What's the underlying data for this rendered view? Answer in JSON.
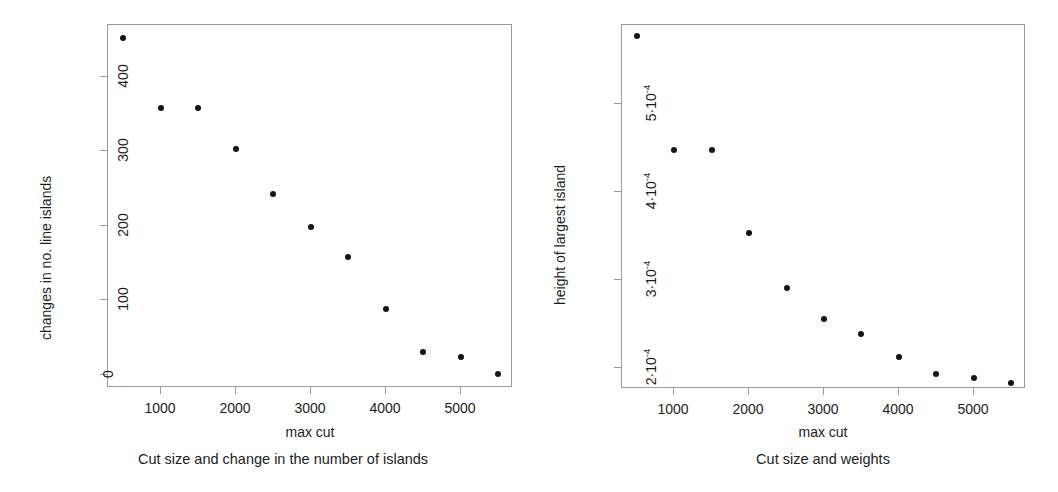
{
  "figure": {
    "background": "#ffffff",
    "point_color": "#151515",
    "axis_color": "#9a9a9a"
  },
  "chart_data": [
    {
      "type": "scatter",
      "panel": "left",
      "title": "",
      "caption": "Cut size and change in the number of islands",
      "xlabel": "max cut",
      "ylabel": "changes in no. line islands",
      "grid": false,
      "legend": "none",
      "xlim": [
        300,
        5700
      ],
      "ylim": [
        -18,
        470
      ],
      "xticks": [
        1000,
        2000,
        3000,
        4000,
        5000
      ],
      "xtick_labels": [
        "1000",
        "2000",
        "3000",
        "4000",
        "5000"
      ],
      "yticks": [
        0,
        100,
        200,
        300,
        400
      ],
      "ytick_labels": [
        "0",
        "100",
        "200",
        "300",
        "400"
      ],
      "x": [
        500,
        1000,
        1500,
        2000,
        2500,
        3000,
        3500,
        4000,
        4500,
        5000,
        5500
      ],
      "y": [
        452,
        359,
        359,
        303,
        243,
        199,
        158,
        88,
        30,
        24,
        1
      ],
      "point_labels": [
        "500, 452",
        "1000, 359",
        "1500, 359",
        "2000, 303",
        "2500, 243",
        "3000, 199",
        "3500, 158",
        "4000, 88",
        "4500, 30",
        "5000, 24",
        "5500, 1"
      ]
    },
    {
      "type": "scatter",
      "panel": "right",
      "title": "",
      "caption": "Cut size and weights",
      "xlabel": "max cut",
      "ylabel": "height of largest island",
      "grid": false,
      "legend": "none",
      "xlim": [
        300,
        5700
      ],
      "ylim": [
        0.000176,
        0.00059
      ],
      "xticks": [
        1000,
        2000,
        3000,
        4000,
        5000
      ],
      "xtick_labels": [
        "1000",
        "2000",
        "3000",
        "4000",
        "5000"
      ],
      "yticks": [
        0.0002,
        0.0003,
        0.0004,
        0.0005
      ],
      "ytick_labels": [
        "2·10",
        "3·10",
        "4·10",
        "5·10"
      ],
      "ytick_exponent": "-4",
      "x": [
        500,
        1000,
        1500,
        2000,
        2500,
        3000,
        3500,
        4000,
        4500,
        5000,
        5500
      ],
      "y": [
        0.000578,
        0.000448,
        0.000448,
        0.000353,
        0.000291,
        0.000256,
        0.000238,
        0.000212,
        0.000193,
        0.000189,
        0.000183
      ],
      "point_labels": [
        "500, 5.78e-4",
        "1000, 4.48e-4",
        "1500, 4.48e-4",
        "2000, 3.53e-4",
        "2500, 2.91e-4",
        "3000, 2.56e-4",
        "3500, 2.38e-4",
        "4000, 2.12e-4",
        "4500, 1.93e-4",
        "5000, 1.89e-4",
        "5500, 1.83e-4"
      ]
    }
  ]
}
